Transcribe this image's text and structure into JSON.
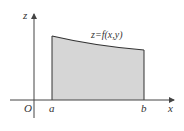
{
  "diagram": {
    "type": "area-under-curve",
    "labels": {
      "z_axis": "z",
      "x_axis": "x",
      "origin": "O",
      "left_bound": "a",
      "right_bound": "b",
      "curve": "z=f(x,y)"
    },
    "colors": {
      "fill": "#d6d6d6",
      "stroke": "#333333",
      "axis": "#444444"
    }
  }
}
